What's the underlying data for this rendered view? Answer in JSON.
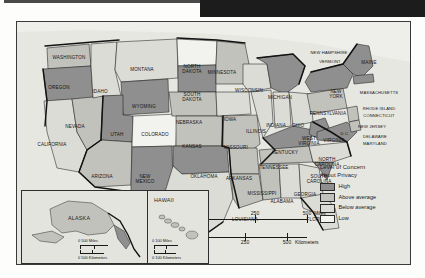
{
  "map": {
    "title_banner": "",
    "legend": {
      "title_line1": "Level of Concern",
      "title_line2": "About Privacy",
      "items": [
        {
          "label": "High",
          "color": "#8f8f8f"
        },
        {
          "label": "Above average",
          "color": "#c2c2bd"
        },
        {
          "label": "Below average",
          "color": "#dcdcd7"
        },
        {
          "label": "Low",
          "color": "#f2f2ee"
        }
      ]
    },
    "scale_main": {
      "miles": {
        "ticks": [
          "0",
          "250",
          "500"
        ],
        "unit": "Miles"
      },
      "kilometers": {
        "ticks": [
          "0",
          "250",
          "500"
        ],
        "unit": "Kilometers"
      }
    },
    "insets": [
      {
        "name": "ALASKA",
        "scale_miles": "0    500 Miles",
        "scale_km": "0 500 Kilometers"
      },
      {
        "name": "HAWAII",
        "scale_miles": "0    100 Miles",
        "scale_km": "0  100 Kilometers"
      }
    ],
    "states": [
      {
        "name": "WASHINGTON",
        "x": 52,
        "y": 36,
        "level": "Above average"
      },
      {
        "name": "OREGON",
        "x": 42,
        "y": 66,
        "level": "High"
      },
      {
        "name": "IDAHO",
        "x": 83,
        "y": 70,
        "level": "Above average"
      },
      {
        "name": "MONTANA",
        "x": 125,
        "y": 48,
        "level": "Above average"
      },
      {
        "name": "WYOMING",
        "x": 127,
        "y": 85,
        "level": "High"
      },
      {
        "name": "NEVADA",
        "x": 58,
        "y": 105,
        "level": "Above average"
      },
      {
        "name": "CALIFORNIA",
        "x": 35,
        "y": 123,
        "level": "Below average"
      },
      {
        "name": "UTAH",
        "x": 100,
        "y": 113,
        "level": "High"
      },
      {
        "name": "ARIZONA",
        "x": 85,
        "y": 155,
        "level": "Above average"
      },
      {
        "name": "COLORADO",
        "x": 138,
        "y": 113,
        "level": "Low"
      },
      {
        "name": "NEW\nMEXICO",
        "x": 128,
        "y": 157,
        "level": "High"
      },
      {
        "name": "NORTH\nDAKOTA",
        "x": 175,
        "y": 47,
        "level": "Low"
      },
      {
        "name": "SOUTH\nDAKOTA",
        "x": 175,
        "y": 75,
        "level": "High"
      },
      {
        "name": "NEBRASKA",
        "x": 172,
        "y": 101,
        "level": "Above average"
      },
      {
        "name": "KANSAS",
        "x": 175,
        "y": 125,
        "level": "Above average"
      },
      {
        "name": "OKLAHOMA",
        "x": 187,
        "y": 155,
        "level": "High"
      },
      {
        "name": "TEXAS",
        "x": 178,
        "y": 188,
        "level": "Below average"
      },
      {
        "name": "MINNESOTA",
        "x": 205,
        "y": 51,
        "level": "Above average"
      },
      {
        "name": "IOWA",
        "x": 213,
        "y": 98,
        "level": "Below average"
      },
      {
        "name": "MISSOURI",
        "x": 219,
        "y": 126,
        "level": "Above average"
      },
      {
        "name": "ARKANSAS",
        "x": 222,
        "y": 157,
        "level": "Above average"
      },
      {
        "name": "LOUISIANA",
        "x": 228,
        "y": 198,
        "level": "Above average"
      },
      {
        "name": "WISCONSIN",
        "x": 232,
        "y": 69,
        "level": "Below average"
      },
      {
        "name": "ILLINOIS",
        "x": 239,
        "y": 110,
        "level": "Below average"
      },
      {
        "name": "MICHIGAN",
        "x": 263,
        "y": 76,
        "level": "High"
      },
      {
        "name": "INDIANA",
        "x": 259,
        "y": 104,
        "level": "Below average"
      },
      {
        "name": "OHIO",
        "x": 281,
        "y": 104,
        "level": "Below average"
      },
      {
        "name": "KENTUCKY",
        "x": 268,
        "y": 131,
        "level": "High"
      },
      {
        "name": "TENNESSEE",
        "x": 257,
        "y": 146,
        "level": "Above average"
      },
      {
        "name": "MISSISSIPPI",
        "x": 245,
        "y": 172,
        "level": "Above average"
      },
      {
        "name": "ALABAMA",
        "x": 265,
        "y": 180,
        "level": "Below average"
      },
      {
        "name": "GEORGIA",
        "x": 288,
        "y": 173,
        "level": "Below average"
      },
      {
        "name": "FLORIDA",
        "x": 300,
        "y": 198,
        "level": "Below average"
      },
      {
        "name": "SOUTH\nCAROLINA",
        "x": 302,
        "y": 157,
        "level": "High"
      },
      {
        "name": "NORTH\nCAROLINA",
        "x": 310,
        "y": 140,
        "level": "Below average"
      },
      {
        "name": "WEST\nVIRGINIA",
        "x": 292,
        "y": 119,
        "level": "High"
      },
      {
        "name": "VIRGINIA",
        "x": 317,
        "y": 119,
        "level": "High"
      },
      {
        "name": "PENNSYLVANIA",
        "x": 311,
        "y": 92,
        "level": "Above average"
      },
      {
        "name": "NEW\nYORK",
        "x": 319,
        "y": 72,
        "level": "High"
      },
      {
        "name": "MAINE",
        "x": 352,
        "y": 41,
        "level": "High"
      },
      {
        "name": "NEW HAMPSHIRE",
        "x": 312,
        "y": 31,
        "level": "High"
      },
      {
        "name": "VERMONT",
        "x": 313,
        "y": 40,
        "level": "High"
      },
      {
        "name": "MASSACHUSETTS",
        "x": 362,
        "y": 71,
        "level": "High"
      },
      {
        "name": "RHODE ISLAND",
        "x": 362,
        "y": 87,
        "level": "High"
      },
      {
        "name": "CONNECTICUT",
        "x": 362,
        "y": 94,
        "level": "High"
      },
      {
        "name": "NEW JERSEY",
        "x": 355,
        "y": 105,
        "level": "Above average"
      },
      {
        "name": "DELAWARE",
        "x": 358,
        "y": 115,
        "level": "Above average"
      },
      {
        "name": "MARYLAND",
        "x": 358,
        "y": 122,
        "level": "Above average"
      },
      {
        "name": "D.C.",
        "x": 328,
        "y": 112,
        "level": "High"
      }
    ]
  }
}
